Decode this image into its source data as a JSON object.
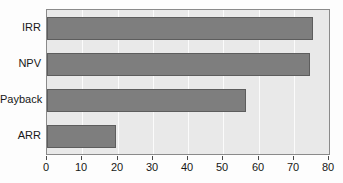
{
  "chart_data": {
    "type": "bar",
    "orientation": "horizontal",
    "title": "",
    "subtitle": "",
    "xlabel": "",
    "ylabel": "",
    "categories": [
      "IRR",
      "NPV",
      "Payback",
      "ARR"
    ],
    "values": [
      75.5,
      74.5,
      56.5,
      19.5
    ],
    "series": [
      {
        "name": "",
        "values": [
          75.5,
          74.5,
          56.5,
          19.5
        ]
      }
    ],
    "xlim": [
      0,
      80
    ],
    "xticks": [
      0,
      10,
      20,
      30,
      40,
      50,
      60,
      70,
      80
    ],
    "xtick_labels": [
      "0",
      "10",
      "20",
      "30",
      "40",
      "50",
      "60",
      "70",
      "80"
    ],
    "grid": "vertical",
    "legend": false,
    "legend_position": "none",
    "bar_color": "#7e7e7e",
    "bar_edge_color": "#5d5d5d",
    "plot_background": "#e9e9e9",
    "grid_color": "#fbfbfb",
    "axis_color": "#8a8a8a",
    "text_color": "#171717",
    "figure_background": "#fdfdfd"
  }
}
